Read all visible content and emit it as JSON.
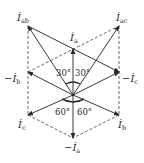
{
  "diagram": {
    "type": "phasor-diagram",
    "labels": {
      "I_ab": {
        "main": "İ",
        "sub": "ab",
        "prefix": ""
      },
      "I_ac": {
        "main": "İ",
        "sub": "ac",
        "prefix": ""
      },
      "I_a": {
        "main": "İ",
        "sub": "a",
        "prefix": ""
      },
      "neg_I_b": {
        "main": "İ",
        "sub": "b",
        "prefix": "−"
      },
      "neg_I_c": {
        "main": "İ",
        "sub": "c",
        "prefix": "−"
      },
      "I_c": {
        "main": "İ",
        "sub": "c",
        "prefix": ""
      },
      "I_b": {
        "main": "İ",
        "sub": "b",
        "prefix": ""
      },
      "neg_I_a": {
        "main": "İ",
        "sub": "a",
        "prefix": "−"
      }
    },
    "angles": {
      "upper_left": "30°",
      "upper_right": "30°",
      "lower_left": "60°",
      "lower_right": "60°"
    },
    "colors": {
      "line": "#3a3a3a",
      "text": "#2a2a2a",
      "background": "#ffffff"
    }
  }
}
